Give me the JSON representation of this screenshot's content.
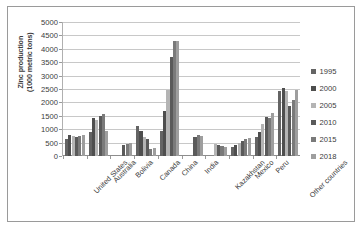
{
  "chart_data": {
    "type": "bar",
    "title": "",
    "xlabel": "",
    "ylabel": "Zinc production (1000 metric tons)",
    "ylabel_line1": "Zinc production",
    "ylabel_line2": "(1000 metric tons)",
    "ylim": [
      0,
      5000
    ],
    "ytick_step": 500,
    "yticks": [
      0,
      500,
      1000,
      1500,
      2000,
      2500,
      3000,
      3500,
      4000,
      4500,
      5000
    ],
    "grid": true,
    "legend_position": "right",
    "categories": [
      "United States",
      "Australia",
      "Bolivia",
      "Canada",
      "China",
      "India",
      "Kazakhstan",
      "Mexico",
      "Peru",
      "Other countries"
    ],
    "series": [
      {
        "name": "1995",
        "color": "#646464",
        "values": [
          630,
          900,
          0,
          1110,
          950,
          0,
          0,
          350,
          700,
          2440
        ]
      },
      {
        "name": "2000",
        "color": "#4e4e4e",
        "values": [
          800,
          1420,
          0,
          930,
          1690,
          0,
          0,
          400,
          900,
          2540
        ]
      },
      {
        "name": "2005",
        "color": "#b4b4b4",
        "values": [
          740,
          1330,
          0,
          700,
          2450,
          0,
          430,
          470,
          1200,
          2420
        ]
      },
      {
        "name": "2010",
        "color": "#5a5a5a",
        "values": [
          720,
          1480,
          420,
          630,
          3700,
          700,
          400,
          570,
          1470,
          1850
        ]
      },
      {
        "name": "2015",
        "color": "#7a7a7a",
        "values": [
          760,
          1570,
          450,
          280,
          4280,
          790,
          370,
          650,
          1420,
          2080
        ]
      },
      {
        "name": "2018",
        "color": "#9e9e9e",
        "values": [
          790,
          940,
          480,
          300,
          4300,
          740,
          340,
          660,
          1590,
          2460
        ]
      }
    ]
  },
  "legend": {
    "items": [
      {
        "label": "1995"
      },
      {
        "label": "2000"
      },
      {
        "label": "2005"
      },
      {
        "label": "2010"
      },
      {
        "label": "2015"
      },
      {
        "label": "2018"
      }
    ]
  }
}
